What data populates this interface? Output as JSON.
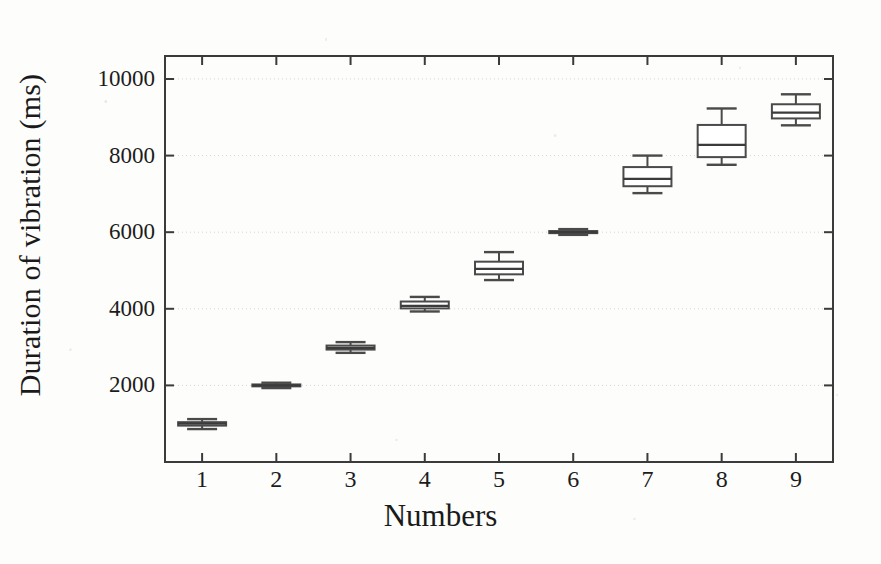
{
  "chart_data": {
    "type": "box",
    "title": "",
    "xlabel": "Numbers",
    "ylabel": "Duration of vibration (ms)",
    "categories": [
      "1",
      "2",
      "3",
      "4",
      "5",
      "6",
      "7",
      "8",
      "9"
    ],
    "xlim": [
      0.5,
      9.5
    ],
    "ylim": [
      0,
      10600
    ],
    "ytick_labels": [
      "2000",
      "4000",
      "6000",
      "8000",
      "10000"
    ],
    "ytick_values": [
      2000,
      4000,
      6000,
      8000,
      10000
    ],
    "grid": "horizontal-dotted",
    "legend": "none",
    "boxes": [
      {
        "category": "1",
        "whisker_low": 860,
        "q1": 950,
        "median": 1000,
        "q3": 1040,
        "whisker_high": 1120
      },
      {
        "category": "2",
        "whisker_low": 1930,
        "q1": 1975,
        "median": 2000,
        "q3": 2025,
        "whisker_high": 2070
      },
      {
        "category": "3",
        "whisker_low": 2850,
        "q1": 2935,
        "median": 2980,
        "q3": 3040,
        "whisker_high": 3130
      },
      {
        "category": "4",
        "whisker_low": 3930,
        "q1": 4010,
        "median": 4075,
        "q3": 4190,
        "whisker_high": 4310
      },
      {
        "category": "5",
        "whisker_low": 4750,
        "q1": 4900,
        "median": 5040,
        "q3": 5230,
        "whisker_high": 5480
      },
      {
        "category": "6",
        "whisker_low": 5930,
        "q1": 5975,
        "median": 6000,
        "q3": 6030,
        "whisker_high": 6080
      },
      {
        "category": "7",
        "whisker_low": 7020,
        "q1": 7200,
        "median": 7390,
        "q3": 7700,
        "whisker_high": 8000
      },
      {
        "category": "8",
        "whisker_low": 7760,
        "q1": 7960,
        "median": 8280,
        "q3": 8800,
        "whisker_high": 9230
      },
      {
        "category": "9",
        "whisker_low": 8790,
        "q1": 8970,
        "median": 9120,
        "q3": 9340,
        "whisker_high": 9600
      }
    ],
    "colors": {
      "axis": "#3b3b3b",
      "box_stroke": "#4a4a4a",
      "box_fill": "#ffffff",
      "median": "#3b3b3b",
      "whisker": "#4a4a4a",
      "grid": "#cfcfcf",
      "text": "#1c1c1c",
      "background": "#fdfdfb"
    }
  }
}
